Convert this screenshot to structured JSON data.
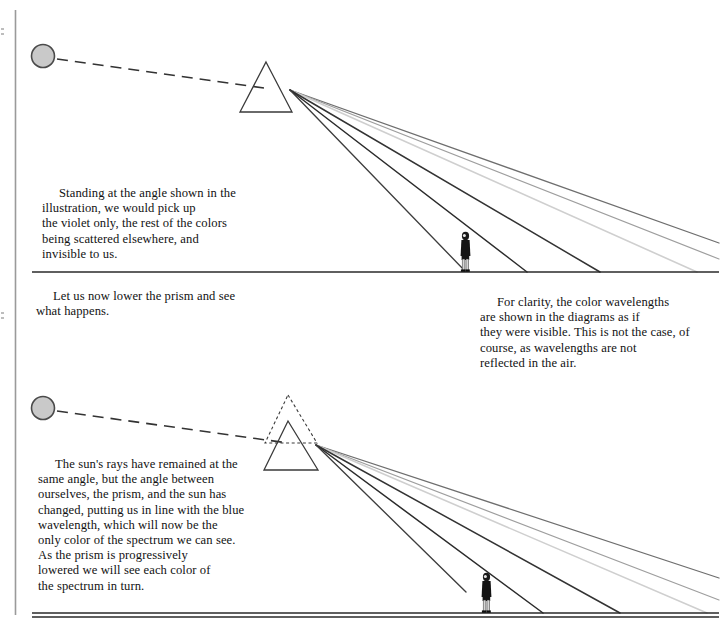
{
  "page": {
    "width": 720,
    "height": 623,
    "background": "#ffffff",
    "ink": "#121212",
    "margin_rule_x": 15,
    "rules": [
      {
        "name": "top-separator",
        "x1": 32,
        "x2": 719,
        "y": 272
      },
      {
        "name": "bottom-separator",
        "x1": 32,
        "x2": 719,
        "y": 616
      }
    ]
  },
  "text_blocks": [
    {
      "id": "caption-violet-only",
      "indent": true,
      "body": "Standing at the angle shown in the\nillustration, we would pick up\nthe violet only, the rest of the colors\nbeing scattered elsewhere, and\ninvisible to us."
    },
    {
      "id": "caption-lower-prism",
      "indent": true,
      "body": "Let us now lower the prism and see\nwhat happens."
    },
    {
      "id": "caption-for-clarity",
      "indent": true,
      "body": "For clarity, the color wavelengths\nare shown in the diagrams as if\nthey were visible. This is not the case, of\ncourse, as wavelengths are not\nreflected in the air."
    },
    {
      "id": "caption-blue-wavelength",
      "indent": true,
      "body": "The sun's rays have remained at the\nsame angle, but the angle between\nourselves, the prism, and the sun has\nchanged, putting us in line with the blue\nwavelength, which will now be the\nonly color of the spectrum we can see.\nAs the prism is progressively\nlowered we will see each color of\nthe spectrum in turn."
    }
  ],
  "diagrams": [
    {
      "id": "diagram-top",
      "ground_y": 272,
      "sun": {
        "cx": 43,
        "cy": 56,
        "r": 12,
        "fill": "#c9c9c9",
        "stroke": "#4a4a4a"
      },
      "incident_ray": {
        "x1": 57,
        "y1": 59,
        "x2": 262,
        "y2": 88,
        "style": "dashed"
      },
      "prism_solid": {
        "apex_x": 266,
        "apex_y": 62,
        "base_left_x": 240,
        "base_right_x": 292,
        "base_y": 112
      },
      "prism_dashed": null,
      "ray_origin": {
        "x": 290,
        "y": 90
      },
      "observer": {
        "x": 465,
        "ground_y": 272,
        "height": 40
      },
      "rays": [
        {
          "name": "ray-violet",
          "end_x": 465,
          "end_y": 272,
          "color": "#3b3b3b",
          "width": 1.4
        },
        {
          "name": "ray-indigo",
          "end_x": 527,
          "end_y": 272,
          "color": "#2b2b2b",
          "width": 1.4
        },
        {
          "name": "ray-blue",
          "end_x": 600,
          "end_y": 272,
          "color": "#333333",
          "width": 1.5
        },
        {
          "name": "ray-green",
          "end_x": 697,
          "end_y": 272,
          "color": "#cfcfcf",
          "width": 1.5
        },
        {
          "name": "ray-yellow",
          "end_x": 719,
          "end_y": 259,
          "color": "#9a9a9a",
          "width": 1.3
        },
        {
          "name": "ray-red",
          "end_x": 719,
          "end_y": 243,
          "color": "#6e6e6e",
          "width": 1.3
        }
      ]
    },
    {
      "id": "diagram-bottom",
      "ground_y": 613,
      "sun": {
        "cx": 43,
        "cy": 408,
        "r": 12,
        "fill": "#c9c9c9",
        "stroke": "#4a4a4a"
      },
      "incident_ray": {
        "x1": 57,
        "y1": 411,
        "x2": 286,
        "y2": 443,
        "style": "dashed"
      },
      "prism_solid": {
        "apex_x": 288,
        "apex_y": 421,
        "base_left_x": 264,
        "base_right_x": 318,
        "base_y": 470
      },
      "prism_dashed": {
        "apex_x": 288,
        "apex_y": 395,
        "base_left_x": 265,
        "base_right_x": 317,
        "base_y": 443
      },
      "ray_origin": {
        "x": 316,
        "y": 445
      },
      "observer": {
        "x": 486,
        "ground_y": 613,
        "height": 40
      },
      "rays": [
        {
          "name": "ray-violet",
          "end_x": 466,
          "end_y": 613,
          "color": "#3b3b3b",
          "width": 1.4
        },
        {
          "name": "ray-blue",
          "end_x": 543,
          "end_y": 613,
          "color": "#2b2b2b",
          "width": 1.5
        },
        {
          "name": "ray-cyan",
          "end_x": 620,
          "end_y": 613,
          "color": "#333333",
          "width": 1.5
        },
        {
          "name": "ray-green",
          "end_x": 707,
          "end_y": 613,
          "color": "#cfcfcf",
          "width": 1.5
        },
        {
          "name": "ray-yellow",
          "end_x": 719,
          "end_y": 600,
          "color": "#9a9a9a",
          "width": 1.3
        },
        {
          "name": "ray-red",
          "end_x": 719,
          "end_y": 578,
          "color": "#6e6e6e",
          "width": 1.3
        }
      ]
    }
  ],
  "colors": {
    "ink": "#121212",
    "rule": "#2a2a2a",
    "sun_fill": "#c9c9c9",
    "sun_stroke": "#4a4a4a",
    "prism_stroke": "#3a3a3a",
    "figure_dark": "#121212",
    "figure_light": "#d8d8d8"
  }
}
